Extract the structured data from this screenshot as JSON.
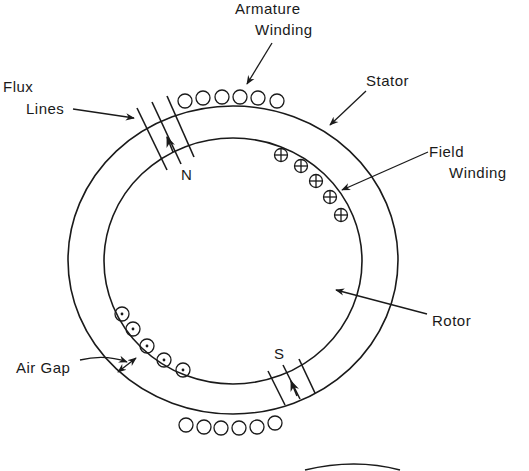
{
  "diagram": {
    "labels": {
      "armature_winding": [
        "Armature",
        "Winding"
      ],
      "flux_lines": [
        "Flux",
        "Lines"
      ],
      "stator": "Stator",
      "field_winding": [
        "Field",
        "Winding"
      ],
      "rotor": "Rotor",
      "air_gap": "Air Gap",
      "north_pole": "N",
      "south_pole": "S"
    },
    "colors": {
      "stroke": "#1a1a1a",
      "background": "#ffffff"
    },
    "stator_outline": {
      "cx": 233,
      "cy": 260,
      "rx": 165,
      "ry": 154
    },
    "rotor_outline": {
      "cx": 233,
      "cy": 261,
      "rx": 129,
      "ry": 123
    },
    "armature_top_conductors": [
      [
        185,
        101
      ],
      [
        203,
        98
      ],
      [
        222,
        97
      ],
      [
        240,
        97
      ],
      [
        258,
        98
      ],
      [
        277,
        101
      ]
    ],
    "armature_bottom_conductors": [
      [
        186,
        425
      ],
      [
        204,
        427
      ],
      [
        221,
        428
      ],
      [
        239,
        428
      ],
      [
        257,
        427
      ],
      [
        275,
        423
      ]
    ],
    "field_winding_cross_conductors": [
      [
        281,
        155
      ],
      [
        301,
        166
      ],
      [
        316,
        181
      ],
      [
        330,
        197
      ],
      [
        341,
        215
      ]
    ],
    "field_winding_dot_conductors": [
      [
        122,
        314
      ],
      [
        133,
        329
      ],
      [
        147,
        346
      ],
      [
        164,
        360
      ],
      [
        183,
        370
      ]
    ]
  }
}
